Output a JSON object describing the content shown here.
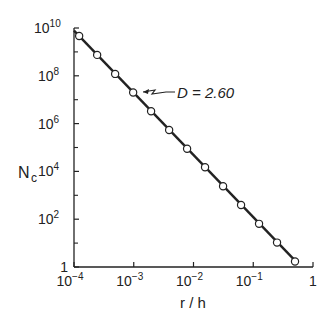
{
  "chart_data": {
    "type": "scatter",
    "title": "",
    "xlabel": "r / h",
    "ylabel": "N_c",
    "xscale": "log",
    "yscale": "log",
    "xlim": [
      0.0001,
      1
    ],
    "ylim": [
      1,
      10000000000
    ],
    "grid": false,
    "x_ticks": [
      "10^-4",
      "10^-3",
      "10^-2",
      "10^-1",
      "1"
    ],
    "y_ticks": [
      "1",
      "10^2",
      "10^4",
      "10^6",
      "10^8",
      "10^10"
    ],
    "annotation": "D = 2.60",
    "series": [
      {
        "name": "N_c",
        "marker": "open-circle",
        "line": "fit, slope -2.60",
        "x": [
          0.000122,
          0.000244,
          0.000488,
          0.000977,
          0.00195,
          0.00391,
          0.00781,
          0.0156,
          0.03125,
          0.0625,
          0.125,
          0.25,
          0.5
        ],
        "y": [
          4600000000.0,
          750000000.0,
          120000000.0,
          20000000.0,
          3300000.0,
          540000.0,
          89000.0,
          15000.0,
          2400.0,
          390,
          64,
          10.5,
          1.7
        ]
      }
    ]
  },
  "labels": {
    "annotation": "D = 2.60",
    "ylabel_main": "N",
    "ylabel_sub": "c",
    "xlabel": "r / h"
  }
}
